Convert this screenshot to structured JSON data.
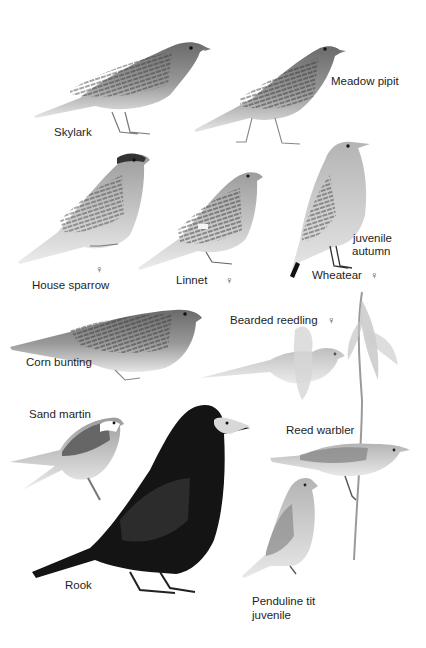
{
  "plate": {
    "background": "#ffffff",
    "ink": "#1e1e1e",
    "birds": [
      {
        "id": "skylark",
        "label": "Skylark"
      },
      {
        "id": "meadow-pipit",
        "label": "Meadow pipit"
      },
      {
        "id": "house-sparrow",
        "label": "House sparrow",
        "sex": "♀"
      },
      {
        "id": "linnet",
        "label": "Linnet",
        "sex": "♀"
      },
      {
        "id": "wheatear",
        "label": "Wheatear",
        "sex": "♀",
        "note_line1": "juvenile",
        "note_line2": "autumn"
      },
      {
        "id": "corn-bunting",
        "label": "Corn bunting"
      },
      {
        "id": "bearded-reedling",
        "label": "Bearded reedling",
        "sex": "♀"
      },
      {
        "id": "sand-martin",
        "label": "Sand martin"
      },
      {
        "id": "rook",
        "label": "Rook"
      },
      {
        "id": "reed-warbler",
        "label": "Reed warbler"
      },
      {
        "id": "penduline-tit",
        "label": "Penduline tit",
        "note_line1": "juvenile"
      }
    ]
  }
}
